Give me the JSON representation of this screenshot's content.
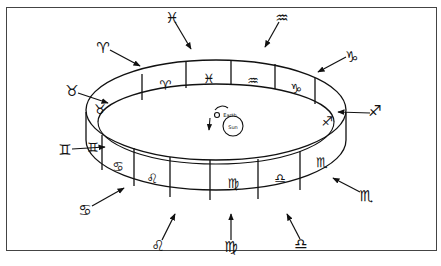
{
  "figure": {
    "labels": {
      "earth": "Earth",
      "sun": "Sun"
    },
    "band_signs": [
      {
        "name": "taurus",
        "glyph": "♉",
        "x": 100,
        "y": 109
      },
      {
        "name": "aries",
        "glyph": "♈",
        "x": 165,
        "y": 85
      },
      {
        "name": "pisces",
        "glyph": "♓",
        "x": 210,
        "y": 80
      },
      {
        "name": "aquarius",
        "glyph": "♒",
        "x": 253,
        "y": 82
      },
      {
        "name": "capricorn",
        "glyph": "♑",
        "x": 296,
        "y": 93
      },
      {
        "name": "sagittarius",
        "glyph": "♐",
        "x": 327,
        "y": 123
      },
      {
        "name": "gemini",
        "glyph": "♊",
        "x": 124,
        "y": 148
      },
      {
        "name": "cancer",
        "glyph": "♋",
        "x": 148,
        "y": 170
      },
      {
        "name": "leo",
        "glyph": "♌",
        "x": 185,
        "y": 180
      },
      {
        "name": "virgo",
        "glyph": "♍",
        "x": 232,
        "y": 185
      },
      {
        "name": "libra",
        "glyph": "♎",
        "x": 277,
        "y": 181
      },
      {
        "name": "scorpio",
        "glyph": "♏",
        "x": 318,
        "y": 164
      }
    ],
    "outer_signs": [
      {
        "name": "aries",
        "glyph": "♈",
        "x": 103,
        "y": 48
      },
      {
        "name": "pisces",
        "glyph": "♓",
        "x": 172,
        "y": 18
      },
      {
        "name": "aquarius",
        "glyph": "♒",
        "x": 282,
        "y": 18
      },
      {
        "name": "capricorn",
        "glyph": "♑",
        "x": 352,
        "y": 57
      },
      {
        "name": "sagittarius",
        "glyph": "♐",
        "x": 375,
        "y": 111
      },
      {
        "name": "taurus",
        "glyph": "♉",
        "x": 72,
        "y": 91
      },
      {
        "name": "gemini",
        "glyph": "♊",
        "x": 65,
        "y": 150
      },
      {
        "name": "cancer",
        "glyph": "♋",
        "x": 85,
        "y": 210
      },
      {
        "name": "leo",
        "glyph": "♌",
        "x": 158,
        "y": 246
      },
      {
        "name": "virgo",
        "glyph": "♍",
        "x": 231,
        "y": 247
      },
      {
        "name": "libra",
        "glyph": "♎",
        "x": 301,
        "y": 244
      },
      {
        "name": "scorpio",
        "glyph": "♏",
        "x": 366,
        "y": 196
      }
    ]
  }
}
